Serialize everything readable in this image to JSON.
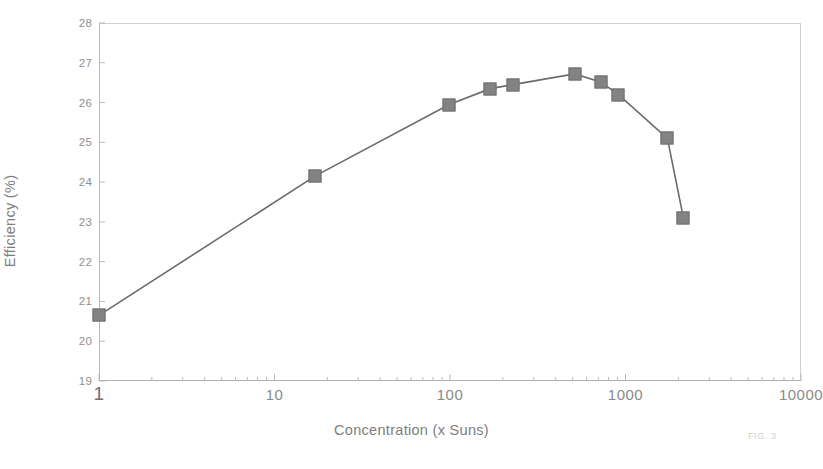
{
  "chart_data": {
    "type": "line",
    "title": "",
    "subtitle": "",
    "xlabel": "Concentration (x Suns)",
    "ylabel": "Efficiency (%)",
    "xscale": "log",
    "yscale": "linear",
    "xlim": [
      1,
      10000
    ],
    "ylim": [
      19,
      28
    ],
    "grid": false,
    "legend": null,
    "legend_position": "none",
    "marker": "square",
    "marker_color": "#838383",
    "line_color": "#6b6b6b",
    "xticks": [
      1,
      10,
      100,
      1000,
      10000
    ],
    "xtick_labels": [
      "1",
      "10",
      "100",
      "1000",
      "10000"
    ],
    "yticks": [
      19,
      20,
      21,
      22,
      23,
      24,
      25,
      26,
      27,
      28
    ],
    "ytick_labels": [
      "19",
      "20",
      "21",
      "22",
      "23",
      "24",
      "25",
      "26",
      "27",
      "28"
    ],
    "x": [
      1,
      17,
      99,
      170,
      228,
      513,
      722,
      912,
      1733,
      2138
    ],
    "y": [
      20.65,
      24.15,
      25.95,
      26.35,
      26.45,
      26.72,
      26.52,
      26.2,
      25.1,
      23.1
    ],
    "series": [
      {
        "name": "Efficiency",
        "points": [
          {
            "x": 1,
            "y": 20.65
          },
          {
            "x": 17,
            "y": 24.15
          },
          {
            "x": 99,
            "y": 25.95
          },
          {
            "x": 170,
            "y": 26.35
          },
          {
            "x": 228,
            "y": 26.45
          },
          {
            "x": 513,
            "y": 26.72
          },
          {
            "x": 722,
            "y": 26.52
          },
          {
            "x": 912,
            "y": 26.2
          },
          {
            "x": 1733,
            "y": 25.1
          },
          {
            "x": 2138,
            "y": 23.1
          }
        ]
      }
    ],
    "annotations": [
      {
        "name": "figure-caption",
        "text": "FIG. 3"
      }
    ]
  },
  "colors": {
    "marker": "#838383",
    "line": "#6b6b6b",
    "axis": "#b9b9b9",
    "tick_text": "#8a8a8a",
    "title_text": "#7e7e7e",
    "caption_text": "#cfcfcf",
    "background": "#ffffff"
  },
  "caption": {
    "text": "FIG. 3"
  }
}
